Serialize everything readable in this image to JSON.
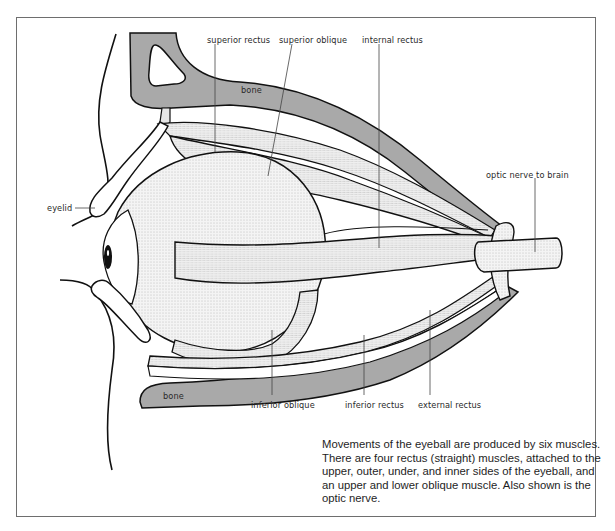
{
  "figure": {
    "labels": {
      "superior_rectus": "superior rectus",
      "superior_oblique": "superior oblique",
      "internal_rectus": "internal rectus",
      "bone_top": "bone",
      "optic_nerve": "optic nerve to brain",
      "eyelid": "eyelid",
      "bone_bottom": "bone",
      "inferior_oblique": "inferior oblique",
      "inferior_rectus": "inferior rectus",
      "external_rectus": "external rectus"
    },
    "caption": "Movements of the eyeball are produced by six muscles. There are four rectus (straight) muscles, attached to the upper, outer, under, and inner sides of the eyeball, and an upper and lower oblique muscle. Also shown is the optic nerve.",
    "colors": {
      "bone": "#a9a9a9",
      "muscle": "#e9e9e9",
      "line": "#111111",
      "frame": "#6e6e6e"
    }
  }
}
